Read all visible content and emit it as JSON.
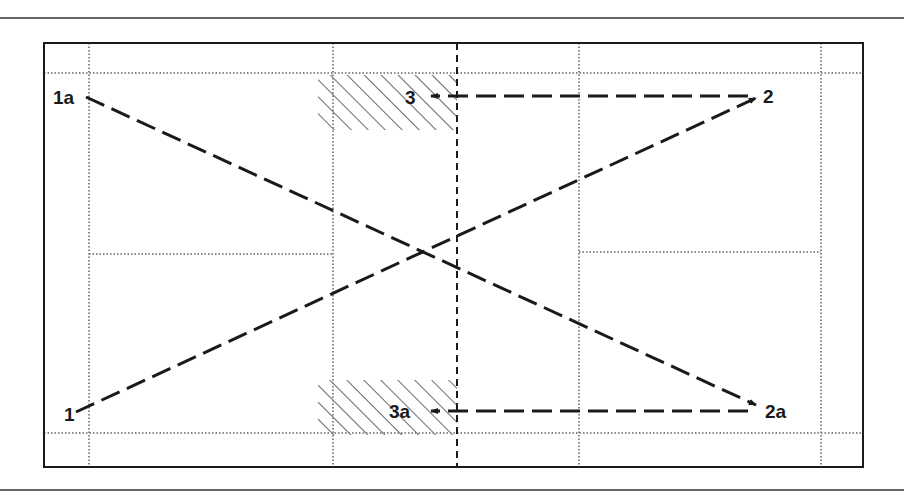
{
  "diagram": {
    "type": "court-movement-diagram",
    "colors": {
      "stroke": "#1a1a1a",
      "dotted": "#8a8a8a",
      "hatch": "#2a2a2a",
      "background": "#ffffff"
    },
    "points": [
      {
        "id": "1",
        "label": "1"
      },
      {
        "id": "1a",
        "label": "1a"
      },
      {
        "id": "2",
        "label": "2"
      },
      {
        "id": "2a",
        "label": "2a"
      },
      {
        "id": "3",
        "label": "3"
      },
      {
        "id": "3a",
        "label": "3a"
      }
    ],
    "movements": [
      {
        "from": "1",
        "to": "2",
        "style": "dashed-arrow"
      },
      {
        "from": "1a",
        "to": "2a",
        "style": "dashed-arrow"
      },
      {
        "from": "2",
        "to": "3",
        "style": "dashed-arrow"
      },
      {
        "from": "2a",
        "to": "3a",
        "style": "dashed-arrow"
      }
    ],
    "hatched_zones": [
      {
        "name": "front-zone-top",
        "near": "3"
      },
      {
        "name": "front-zone-bottom",
        "near": "3a"
      }
    ],
    "center_line": "dashed"
  }
}
